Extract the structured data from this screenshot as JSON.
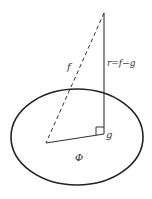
{
  "labels": {
    "f": "f",
    "r": "r=f−g",
    "g": "g",
    "phi": "Φ"
  },
  "colors": {
    "stroke": "#222222",
    "background": "#ffffff"
  }
}
